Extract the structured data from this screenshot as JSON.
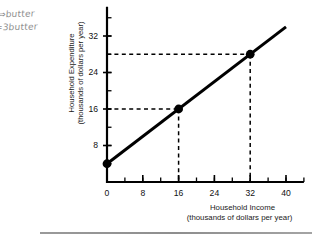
{
  "figure": {
    "annotations": [
      {
        "name": "handwritten-note-1",
        "text": "⇒butter"
      },
      {
        "name": "handwritten-note-2",
        "text": "=3butter"
      }
    ],
    "rule_color": "#949494"
  },
  "chart_data": {
    "type": "line",
    "title": "",
    "xlabel": "Household Income",
    "xlabel_sub": "(thousands of dollars per year)",
    "ylabel": "Household Expenditure",
    "ylabel_sub": "(thousands of dollars per year)",
    "xlim": [
      0,
      44
    ],
    "ylim": [
      0,
      36
    ],
    "xticks": [
      0,
      8,
      16,
      24,
      32,
      40
    ],
    "xticklabels": [
      "0",
      "8",
      "16",
      "24",
      "32",
      "40"
    ],
    "yticks": [
      8,
      16,
      24,
      32
    ],
    "yticklabels": [
      "8",
      "16",
      "24",
      "32"
    ],
    "xminor_step": 4,
    "yminor_step": 4,
    "grid": false,
    "legend": null,
    "line_color": "#000000",
    "line_width": 3,
    "series": [
      {
        "name": "Expenditure curve",
        "x": [
          0,
          40
        ],
        "y": [
          4,
          34
        ]
      }
    ],
    "points": [
      {
        "label": "a",
        "x": 0,
        "y": 4
      },
      {
        "label": "b",
        "x": 16,
        "y": 16
      },
      {
        "label": "c",
        "x": 32,
        "y": 28
      }
    ],
    "guide_lines": [
      {
        "from_point": "b",
        "x": 16,
        "y": 16,
        "style": "dashed"
      },
      {
        "from_point": "c",
        "x": 32,
        "y": 28,
        "style": "dashed"
      }
    ]
  }
}
